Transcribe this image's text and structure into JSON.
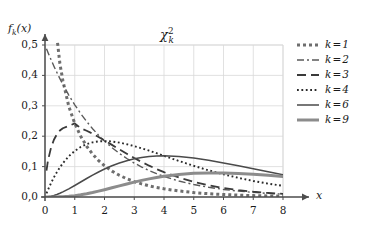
{
  "figure": {
    "title_main": "χ",
    "title_sup": "2",
    "title_sub": "k",
    "ylabel_f": "f",
    "ylabel_sub": "k",
    "ylabel_arg": "(x)",
    "xlabel": "x",
    "grid": "on",
    "grid_color": "#d9d9d9",
    "axis_color": "#4d4d4d",
    "background": "#ffffff"
  },
  "chart_data": {
    "type": "line",
    "xlabel": "x",
    "ylabel": "fₖ(x)",
    "xlim": [
      0,
      8
    ],
    "ylim": [
      0,
      0.55
    ],
    "xticks": [
      "0",
      "1",
      "2",
      "3",
      "4",
      "5",
      "6",
      "7",
      "8"
    ],
    "xtick_values": [
      0,
      1,
      2,
      3,
      4,
      5,
      6,
      7,
      8
    ],
    "yticks": [
      "0,0",
      "0,1",
      "0,2",
      "0,3",
      "0,4",
      "0,5"
    ],
    "ytick_values": [
      0.0,
      0.1,
      0.2,
      0.3,
      0.4,
      0.5
    ],
    "grid": true,
    "legend_position": "right",
    "x": [
      0.05,
      0.1,
      0.2,
      0.3,
      0.4,
      0.5,
      0.6,
      0.8,
      1.0,
      1.2,
      1.4,
      1.6,
      1.8,
      2.0,
      2.25,
      2.5,
      2.75,
      3.0,
      3.25,
      3.5,
      3.75,
      4.0,
      4.5,
      5.0,
      5.5,
      6.0,
      6.5,
      7.0,
      7.5,
      8.0
    ],
    "series": [
      {
        "name": "k = 1",
        "k": 1,
        "style": "dashed",
        "color": "#6e6e6e",
        "width": 3.0,
        "dash": "3,3",
        "values": [
          1.74,
          1.2,
          0.8,
          0.627,
          0.526,
          0.439,
          0.383,
          0.298,
          0.242,
          0.2,
          0.167,
          0.141,
          0.12,
          0.103,
          0.0852,
          0.0713,
          0.0599,
          0.0507,
          0.043,
          0.0366,
          0.0312,
          0.0269,
          0.0199,
          0.0146,
          0.0108,
          0.0081,
          0.0061,
          0.0046,
          0.0034,
          0.0026
        ]
      },
      {
        "name": "k = 2",
        "k": 2,
        "style": "dashdot",
        "color": "#5a5a5a",
        "width": 1.4,
        "dash": "7,3,2,3",
        "values": [
          0.4877,
          0.4756,
          0.4524,
          0.4304,
          0.4094,
          0.3894,
          0.3704,
          0.3352,
          0.3033,
          0.2744,
          0.2483,
          0.2247,
          0.2033,
          0.1839,
          0.1624,
          0.1433,
          0.1266,
          0.1116,
          0.0986,
          0.087,
          0.0768,
          0.0677,
          0.0527,
          0.041,
          0.032,
          0.0249,
          0.0194,
          0.0151,
          0.0118,
          0.0092
        ]
      },
      {
        "name": "k = 3",
        "k": 3,
        "style": "longdash",
        "color": "#3a3a3a",
        "width": 1.8,
        "dash": "9,5",
        "values": [
          0.0867,
          0.12,
          0.1613,
          0.1883,
          0.2064,
          0.2186,
          0.2262,
          0.2337,
          0.242,
          0.2266,
          0.218,
          0.2082,
          0.1974,
          0.186,
          0.1714,
          0.1566,
          0.1421,
          0.1282,
          0.1151,
          0.103,
          0.0918,
          0.0816,
          0.064,
          0.0495,
          0.0383,
          0.0295,
          0.0227,
          0.0174,
          0.0133,
          0.0102
        ]
      },
      {
        "name": "k = 4",
        "k": 4,
        "style": "dotted",
        "color": "#2a2a2a",
        "width": 1.9,
        "dash": "1.8,2.6",
        "values": [
          0.0122,
          0.0238,
          0.0452,
          0.0646,
          0.0819,
          0.0974,
          0.1111,
          0.134,
          0.1516,
          0.1646,
          0.1738,
          0.1797,
          0.183,
          0.1839,
          0.1827,
          0.179,
          0.1737,
          0.1673,
          0.1601,
          0.1523,
          0.1441,
          0.1353,
          0.1186,
          0.1026,
          0.0877,
          0.0747,
          0.0629,
          0.0527,
          0.044,
          0.0366
        ]
      },
      {
        "name": "k = 6",
        "k": 6,
        "style": "solid",
        "color": "#4a4a4a",
        "width": 1.5,
        "dash": "none",
        "values": [
          0.0002,
          0.0006,
          0.0023,
          0.0048,
          0.0082,
          0.0122,
          0.0167,
          0.0268,
          0.0379,
          0.0494,
          0.0608,
          0.0719,
          0.0823,
          0.092,
          0.1028,
          0.1119,
          0.1194,
          0.1255,
          0.13,
          0.133,
          0.1351,
          0.1353,
          0.133,
          0.1282,
          0.1208,
          0.112,
          0.1025,
          0.0926,
          0.083,
          0.0733
        ]
      },
      {
        "name": "k = 9",
        "k": 9,
        "style": "solid",
        "color": "#8c8c8c",
        "width": 3.0,
        "dash": "none",
        "values": [
          0.0,
          0.0,
          0.0,
          0.0001,
          0.0002,
          0.0005,
          0.0009,
          0.0023,
          0.0044,
          0.0072,
          0.0107,
          0.0147,
          0.0192,
          0.024,
          0.0303,
          0.0367,
          0.043,
          0.049,
          0.0546,
          0.0597,
          0.0643,
          0.0682,
          0.0742,
          0.0778,
          0.0793,
          0.0791,
          0.0775,
          0.0748,
          0.0713,
          0.0673
        ]
      }
    ]
  },
  "legend": {
    "items": [
      {
        "label": "k = 1"
      },
      {
        "label": "k = 2"
      },
      {
        "label": "k = 3"
      },
      {
        "label": "k = 4"
      },
      {
        "label": "k = 6"
      },
      {
        "label": "k = 9"
      }
    ]
  }
}
